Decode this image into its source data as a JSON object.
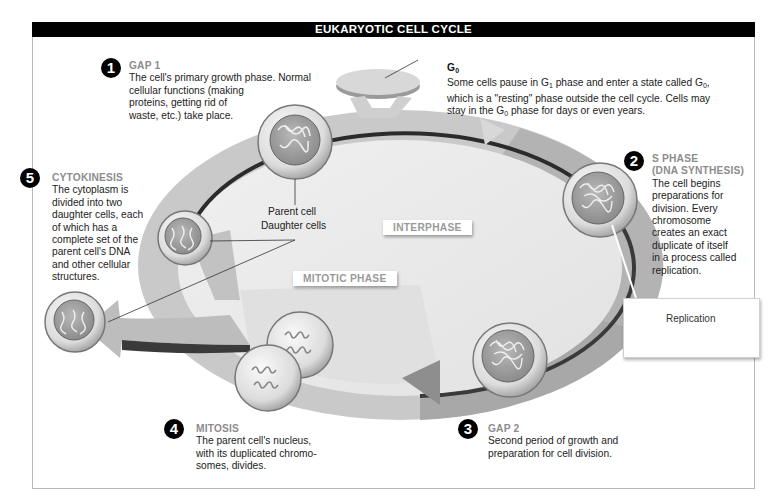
{
  "title": "EUKARYOTIC CELL CYCLE",
  "phases": [
    {
      "number": "1",
      "name": "GAP 1",
      "lines": [
        "The cell's primary growth phase. Normal",
        "cellular functions (making",
        "proteins, getting rid of",
        "waste, etc.) take place."
      ]
    },
    {
      "number": "2",
      "name_lines": [
        "S PHASE",
        "(DNA SYNTHESIS)"
      ],
      "lines": [
        "The cell begins",
        "preparations for",
        "division. Every",
        "chromosome",
        "creates an exact",
        "duplicate of itself",
        "in a process called",
        "replication."
      ]
    },
    {
      "number": "3",
      "name": "GAP 2",
      "lines": [
        "Second period of growth and",
        "preparation for cell division."
      ]
    },
    {
      "number": "4",
      "name": "MITOSIS",
      "lines": [
        "The parent cell's nucleus,",
        "with its duplicated chromo-",
        "somes, divides."
      ]
    },
    {
      "number": "5",
      "name": "CYTOKINESIS",
      "lines": [
        "The cytoplasm is",
        "divided into two",
        "daughter cells, each",
        "of which has a",
        "complete set of the",
        "parent cell's DNA",
        "and other cellular",
        "structures."
      ]
    }
  ],
  "g0": {
    "name": "G",
    "name_sub": "0",
    "line1_a": "Some cells pause in G",
    "line1_sub1": "1",
    "line1_b": " phase and enter a state called G",
    "line1_sub2": "0",
    "line1_c": ",",
    "line2": "which is a \"resting\" phase outside the cell cycle. Cells may",
    "line3_a": "stay in the G",
    "line3_sub": "0",
    "line3_b": " phase for days or even years."
  },
  "labels": {
    "parent_cell": "Parent cell",
    "daughter_cells": "Daughter cells",
    "interphase": "INTERPHASE",
    "mitotic_phase": "MITOTIC PHASE",
    "replication": "Replication"
  },
  "colors": {
    "title_bar": "#000000",
    "ring_light": "#c8c8c8",
    "ring_dark": "#a9a9a9",
    "inner": "#ececec",
    "heading_gray": "#8c8c8c"
  }
}
